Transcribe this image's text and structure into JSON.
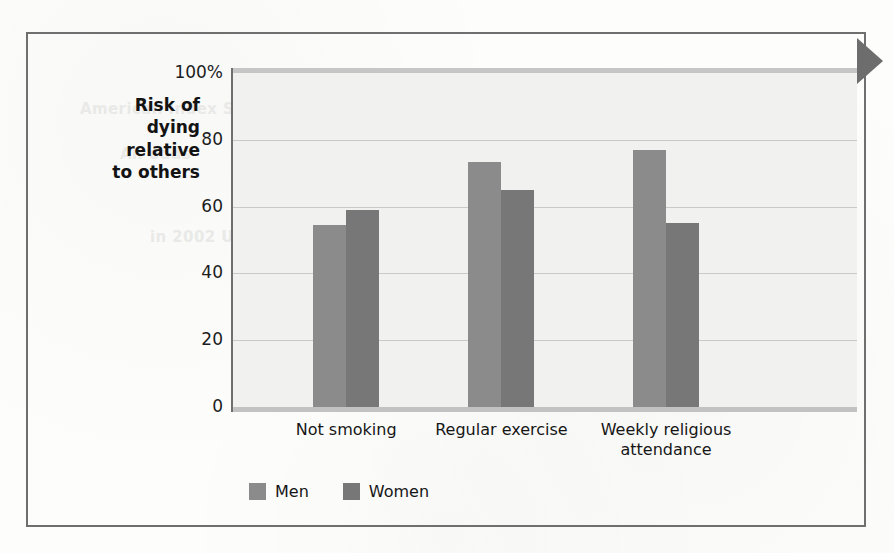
{
  "figure": {
    "edge_marker": "right-pointing-triangle",
    "frame_color": "#6f6f70"
  },
  "chart_data": {
    "type": "bar",
    "title": "",
    "subtitle": "",
    "xlabel": "",
    "ylabel": "Risk of dying relative to others",
    "ylabel_lines": [
      "Risk of",
      "dying",
      "relative",
      "to others"
    ],
    "categories": [
      "Not smoking",
      "Regular exercise",
      "Weekly religious attendance"
    ],
    "category_label_lines": [
      [
        "Not smoking"
      ],
      [
        "Regular exercise"
      ],
      [
        "Weekly religious",
        "attendance"
      ]
    ],
    "series": [
      {
        "name": "Men",
        "values": [
          54.5,
          73.5,
          77
        ],
        "color": "#8b8b8b"
      },
      {
        "name": "Women",
        "values": [
          59,
          65,
          55
        ],
        "color": "#777777"
      }
    ],
    "ylim": [
      0,
      100
    ],
    "yticks": [
      0,
      20,
      40,
      60,
      80,
      100
    ],
    "ytick_labels": [
      "0",
      "20",
      "40",
      "60",
      "80",
      "100%"
    ],
    "grid": true,
    "grid_axis": "y",
    "legend_position": "bottom-left",
    "legend": [
      "Men",
      "Women"
    ],
    "plot_background": "#f1f1f0"
  },
  "bleed_text": [
    {
      "text": "Sunday",
      "x": 640,
      "y": 70,
      "size": 15
    },
    {
      "text": "American Index Stock Market Indices",
      "x": 80,
      "y": 100,
      "size": 15
    },
    {
      "text": "An odds",
      "x": 120,
      "y": 145,
      "size": 15
    },
    {
      "text": "Uncle 100 Treasure Up",
      "x": 310,
      "y": 185,
      "size": 15
    },
    {
      "text": "in 2002 U.S. Sources Report",
      "x": 150,
      "y": 228,
      "size": 15
    },
    {
      "text": "Wisconsin",
      "x": 360,
      "y": 270,
      "size": 15
    },
    {
      "text": "Market",
      "x": 600,
      "y": 320,
      "size": 15
    }
  ]
}
